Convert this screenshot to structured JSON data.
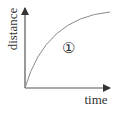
{
  "diagram": {
    "type": "distance-time graph",
    "x_axis": {
      "label": "time"
    },
    "y_axis": {
      "label": "distance"
    },
    "curve": {
      "description": "concave-down increasing curve from origin, flattening toward the top right",
      "marker": "①"
    },
    "colors": {
      "axis": "#333333",
      "curve": "#888888",
      "text": "#333333"
    }
  }
}
